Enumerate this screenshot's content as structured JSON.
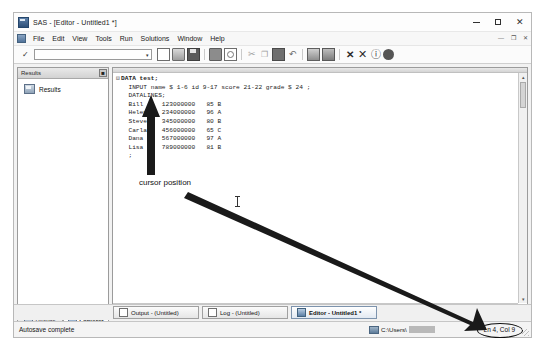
{
  "window": {
    "title": "SAS - [Editor - Untitled1 *]",
    "app_icon": "sas-app-icon",
    "minimize": "—",
    "maximize": "□",
    "close": "✕",
    "mdi_minimize": "—",
    "mdi_restore": "❐",
    "mdi_close": "✕"
  },
  "menu": {
    "items": [
      {
        "label": "File"
      },
      {
        "label": "Edit"
      },
      {
        "label": "View"
      },
      {
        "label": "Tools"
      },
      {
        "label": "Run"
      },
      {
        "label": "Solutions"
      },
      {
        "label": "Window"
      },
      {
        "label": "Help"
      }
    ]
  },
  "toolbar": {
    "submit_check": "✓",
    "command_value": "",
    "command_placeholder": "",
    "dropdown_caret": "▾",
    "buttons": [
      {
        "name": "new-icon",
        "label": "New"
      },
      {
        "name": "open-icon",
        "label": "Open"
      },
      {
        "name": "save-icon",
        "label": "Save"
      },
      {
        "name": "print-icon",
        "label": "Print"
      },
      {
        "name": "print-preview-icon",
        "label": "Print Preview"
      },
      {
        "name": "cut-icon",
        "label": "Cut",
        "glyph": "✂"
      },
      {
        "name": "copy-icon",
        "label": "Copy",
        "glyph": "❐"
      },
      {
        "name": "paste-icon",
        "label": "Paste"
      },
      {
        "name": "undo-icon",
        "label": "Undo",
        "glyph": "↶"
      },
      {
        "name": "submit-icon",
        "label": "Submit"
      },
      {
        "name": "clear-all-icon",
        "label": "Clear All"
      },
      {
        "name": "break-icon",
        "label": "Break",
        "glyph": "✕"
      },
      {
        "name": "stop-icon",
        "label": "Stop",
        "glyph": "✕"
      },
      {
        "name": "help-icon",
        "label": "Help",
        "glyph": "ⓘ"
      },
      {
        "name": "sas-help-icon",
        "label": "SAS Help"
      }
    ]
  },
  "results_panel": {
    "title": "Results",
    "close_glyph": "■",
    "tree": [
      {
        "label": "Results",
        "icon": "results-folder-icon"
      }
    ],
    "tabs": [
      {
        "label": "Results",
        "active": false,
        "icon": "results-tab-icon"
      },
      {
        "label": "Explorer",
        "active": true,
        "icon": "explorer-tab-icon"
      }
    ]
  },
  "editor": {
    "code_lines": [
      {
        "fold": "⊟",
        "text": "DATA test;",
        "bold": true
      },
      {
        "fold": "",
        "text": "  INPUT name $ 1-6 id 9-17 score 21-22 grade $ 24 ;",
        "bold": false
      },
      {
        "fold": "",
        "text": "  DATALINES;",
        "bold": false
      },
      {
        "fold": "",
        "text": "  Bill     123000000   85 B",
        "bold": false
      },
      {
        "fold": "",
        "text": "  Helen    234000000   96 A",
        "bold": false
      },
      {
        "fold": "",
        "text": "  Steven   345000000   80 B",
        "bold": false
      },
      {
        "fold": "",
        "text": "  Carla    456000000   65 C",
        "bold": false
      },
      {
        "fold": "",
        "text": "  Dana     567000000   97 A",
        "bold": false
      },
      {
        "fold": "",
        "text": "  Lisa     789000000   81 B",
        "bold": false
      },
      {
        "fold": "",
        "text": "  ;",
        "bold": false
      }
    ],
    "scroll_up": "▴",
    "scroll_down": "▾",
    "scroll_left": "◂",
    "scroll_right": "▸"
  },
  "taskbar": {
    "tabs": [
      {
        "label": "Output - (Untitled)",
        "active": false,
        "icon": "output-window-icon"
      },
      {
        "label": "Log - (Untitled)",
        "active": false,
        "icon": "log-window-icon"
      },
      {
        "label": "Editor - Untitled1 *",
        "active": true,
        "icon": "editor-window-icon"
      }
    ]
  },
  "status_bar": {
    "message": "Autosave complete",
    "path": "C:\\Users\\",
    "path_redacted": true,
    "position": "Ln 4, Col 9"
  },
  "annotations": {
    "cursor_label": "cursor position",
    "arrow_color": "#1a1a1a"
  }
}
